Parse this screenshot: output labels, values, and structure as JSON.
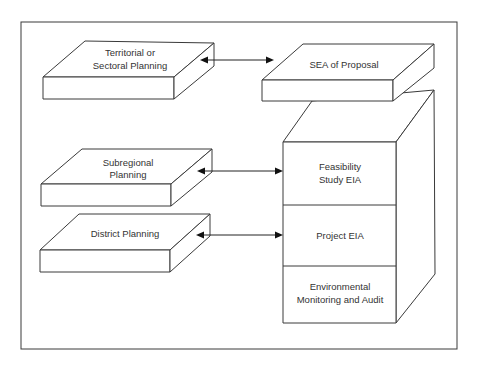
{
  "diagram": {
    "planning_levels": [
      {
        "id": "territorial",
        "label_lines": [
          "Territorial or",
          "Sectoral Planning"
        ]
      },
      {
        "id": "subregional",
        "label_lines": [
          "Subregional",
          "Planning"
        ]
      },
      {
        "id": "district",
        "label_lines": [
          "District Planning"
        ]
      }
    ],
    "assessment_levels": {
      "top": {
        "id": "sea",
        "label_lines": [
          "SEA of Proposal"
        ]
      },
      "stack": [
        {
          "id": "feasibility",
          "label_lines": [
            "Feasibility",
            "Study EIA"
          ]
        },
        {
          "id": "project",
          "label_lines": [
            "Project EIA"
          ]
        },
        {
          "id": "monitoring",
          "label_lines": [
            "Environmental",
            "Monitoring and Audit"
          ]
        }
      ]
    },
    "connections": [
      {
        "from": "territorial",
        "to": "sea",
        "type": "bidirectional"
      },
      {
        "from": "subregional",
        "to": "feasibility",
        "type": "bidirectional"
      },
      {
        "from": "district",
        "to": "project",
        "type": "bidirectional"
      }
    ],
    "colors": {
      "line": "#3a3a3a",
      "text": "#333333",
      "background": "#ffffff"
    }
  }
}
